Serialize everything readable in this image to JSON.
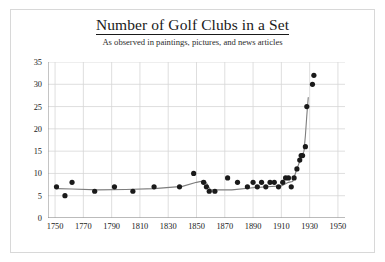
{
  "chart_data": {
    "type": "scatter",
    "title": "Number of Golf Clubs in a Set",
    "subtitle": "As observed in paintings, pictures, and news articles",
    "xlabel": "",
    "ylabel": "",
    "xlim": [
      1745,
      1955
    ],
    "ylim": [
      0,
      35
    ],
    "xticks": [
      1750,
      1770,
      1790,
      1810,
      1830,
      1850,
      1870,
      1890,
      1910,
      1930,
      1950
    ],
    "yticks": [
      0,
      5,
      10,
      15,
      20,
      25,
      30,
      35
    ],
    "grid": true,
    "legend": false,
    "marker_color": "#1a1a1a",
    "line_color": "#7d7d7d",
    "points": [
      {
        "x": 1751,
        "y": 7
      },
      {
        "x": 1757,
        "y": 5
      },
      {
        "x": 1762,
        "y": 8
      },
      {
        "x": 1778,
        "y": 6
      },
      {
        "x": 1792,
        "y": 7
      },
      {
        "x": 1805,
        "y": 6
      },
      {
        "x": 1820,
        "y": 7
      },
      {
        "x": 1838,
        "y": 7
      },
      {
        "x": 1848,
        "y": 10
      },
      {
        "x": 1855,
        "y": 8
      },
      {
        "x": 1857,
        "y": 7
      },
      {
        "x": 1859,
        "y": 6
      },
      {
        "x": 1863,
        "y": 6
      },
      {
        "x": 1872,
        "y": 9
      },
      {
        "x": 1879,
        "y": 8
      },
      {
        "x": 1886,
        "y": 7
      },
      {
        "x": 1890,
        "y": 8
      },
      {
        "x": 1893,
        "y": 7
      },
      {
        "x": 1896,
        "y": 8
      },
      {
        "x": 1899,
        "y": 7
      },
      {
        "x": 1902,
        "y": 8
      },
      {
        "x": 1905,
        "y": 8
      },
      {
        "x": 1908,
        "y": 7
      },
      {
        "x": 1911,
        "y": 8
      },
      {
        "x": 1913,
        "y": 9
      },
      {
        "x": 1915,
        "y": 9
      },
      {
        "x": 1917,
        "y": 7
      },
      {
        "x": 1919,
        "y": 9
      },
      {
        "x": 1921,
        "y": 11
      },
      {
        "x": 1923,
        "y": 13
      },
      {
        "x": 1924,
        "y": 14
      },
      {
        "x": 1925,
        "y": 14
      },
      {
        "x": 1927,
        "y": 16
      },
      {
        "x": 1928,
        "y": 25
      },
      {
        "x": 1932,
        "y": 30
      },
      {
        "x": 1933,
        "y": 32
      }
    ],
    "trend": [
      {
        "x": 1751,
        "y": 6.6
      },
      {
        "x": 1762,
        "y": 6.5
      },
      {
        "x": 1780,
        "y": 6.3
      },
      {
        "x": 1800,
        "y": 6.4
      },
      {
        "x": 1820,
        "y": 6.6
      },
      {
        "x": 1840,
        "y": 7.1
      },
      {
        "x": 1850,
        "y": 8.0
      },
      {
        "x": 1856,
        "y": 8.4
      },
      {
        "x": 1860,
        "y": 6.3
      },
      {
        "x": 1875,
        "y": 6.3
      },
      {
        "x": 1890,
        "y": 6.8
      },
      {
        "x": 1900,
        "y": 7.0
      },
      {
        "x": 1910,
        "y": 7.2
      },
      {
        "x": 1915,
        "y": 8.0
      },
      {
        "x": 1918,
        "y": 8.2
      },
      {
        "x": 1921,
        "y": 11.0
      },
      {
        "x": 1924,
        "y": 13.6
      },
      {
        "x": 1926,
        "y": 15.0
      },
      {
        "x": 1927,
        "y": 18.5
      },
      {
        "x": 1928,
        "y": 23.0
      },
      {
        "x": 1929,
        "y": 27.0
      }
    ]
  }
}
